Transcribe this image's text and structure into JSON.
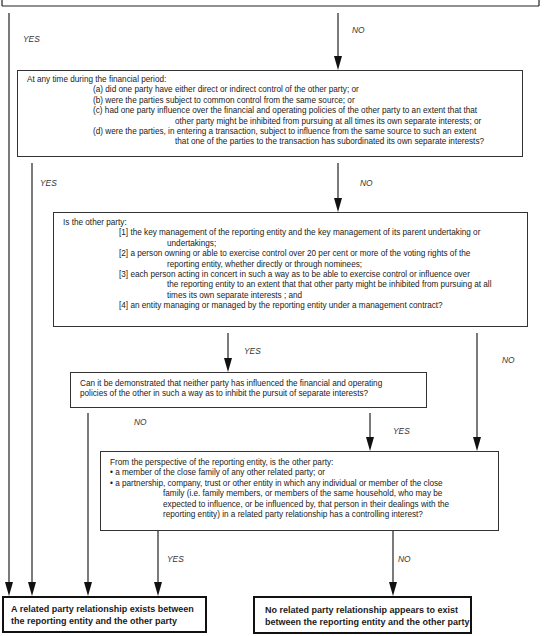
{
  "diagram": {
    "type": "decision-flowchart",
    "boxes": {
      "q1": {
        "intro": "At any time during the financial period:",
        "items": [
          {
            "lines": [
              "(a) did one party have either direct or indirect control of the other party; or"
            ]
          },
          {
            "lines": [
              "(b) were the parties subject to common control from the same source; or"
            ]
          },
          {
            "lines": [
              "(c) had one party influence over the financial and operating policies of the other party to an extent that that",
              "other party might be inhibited from pursuing at all times its own separate interests; or"
            ]
          },
          {
            "lines": [
              "(d) were the parties, in entering a transaction, subject to influence from the same source to such an extent",
              "that one of the parties to the transaction has subordinated its own separate interests?"
            ]
          }
        ]
      },
      "q2": {
        "intro": "Is the other party:",
        "items": [
          {
            "lines": [
              "[1] the key management of the reporting entity and the key management of its parent undertaking or",
              "undertakings;"
            ]
          },
          {
            "lines": [
              "[2] a person owning or able to exercise control over 20 per cent or more of the voting rights of the",
              "reporting entity, whether directly or through nominees;"
            ]
          },
          {
            "lines": [
              "[3] each person acting in concert in such a way as to be able to exercise control or influence over",
              "the reporting entity to an extent that that other party might be inhibited from pursuing at all",
              "times its own separate interests ; and"
            ]
          },
          {
            "lines": [
              "[4] an entity managing or managed by the reporting entity under a management contract?"
            ]
          }
        ]
      },
      "q3": {
        "lines": [
          "Can it be demonstrated that neither party has influenced the financial and operating",
          "policies of the other in such a way as to inhibit the pursuit of separate interests?"
        ]
      },
      "q4": {
        "intro": "From the perspective of the reporting entity, is the other party:",
        "bullet1": "• a member of the close family of any other related party; or",
        "bullet2": [
          "• a partnership, company, trust or other entity in which any individual or member of the close",
          "family (i.e.  family members, or members of the same household, who may be",
          "expected to influence, or be influenced by, that person in their dealings with the",
          "reporting entity) in a related party relationship has a controlling interest?"
        ]
      },
      "outcome_yes": {
        "lines": [
          "A related party relationship exists between",
          "the reporting entity and the other party"
        ]
      },
      "outcome_no": {
        "lines": [
          "No related party relationship appears to exist",
          "between the reporting entity and the other party"
        ]
      }
    },
    "labels": {
      "yes": "YES",
      "no": "NO"
    },
    "colors": {
      "line": "#222222",
      "box_border": "#333333",
      "background": "#ffffff"
    }
  }
}
